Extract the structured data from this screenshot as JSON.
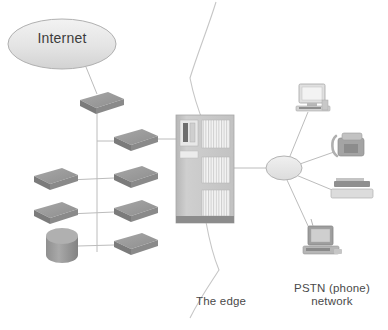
{
  "diagram": {
    "background": "#ffffff",
    "line_color": "#b9b9b9",
    "shape_fill": "#9a9a9a",
    "shape_fill_light": "#d9d9d9",
    "text_color": "#4a4a4a",
    "labels": {
      "internet": "Internet",
      "edge": "The edge",
      "pstn": "PSTN (phone)\nnetwork"
    },
    "nodes": [
      {
        "id": "internet-cloud",
        "type": "cloud-ellipse",
        "label": "Internet",
        "x": 62,
        "y": 44
      },
      {
        "id": "router-top",
        "type": "router-box",
        "label": "",
        "x": 96,
        "y": 99
      },
      {
        "id": "router-upper-right",
        "type": "router-box",
        "label": "",
        "x": 131,
        "y": 136
      },
      {
        "id": "router-mid-left",
        "type": "router-box",
        "label": "",
        "x": 50,
        "y": 175
      },
      {
        "id": "router-mid-right",
        "type": "router-box",
        "label": "",
        "x": 131,
        "y": 173
      },
      {
        "id": "router-low-left",
        "type": "router-box",
        "label": "",
        "x": 50,
        "y": 209
      },
      {
        "id": "router-low-right",
        "type": "router-box",
        "label": "",
        "x": 131,
        "y": 207
      },
      {
        "id": "server-cylinder",
        "type": "cylinder",
        "label": "",
        "x": 62,
        "y": 243
      },
      {
        "id": "router-bottom-right",
        "type": "router-box",
        "label": "",
        "x": 131,
        "y": 240
      },
      {
        "id": "edge-rack",
        "type": "telecom-rack",
        "label": "",
        "x": 205,
        "y": 175
      },
      {
        "id": "pstn-hub",
        "type": "hub-ellipse",
        "label": "",
        "x": 284,
        "y": 168
      },
      {
        "id": "desktop-computer",
        "type": "computer",
        "label": "",
        "x": 313,
        "y": 98
      },
      {
        "id": "desk-telephone",
        "type": "telephone",
        "label": "",
        "x": 349,
        "y": 145
      },
      {
        "id": "fax-printer",
        "type": "printer",
        "label": "",
        "x": 355,
        "y": 190
      },
      {
        "id": "workstation",
        "type": "workstation",
        "label": "",
        "x": 322,
        "y": 240
      }
    ],
    "edges": [
      {
        "from": "internet-cloud",
        "to": "router-top"
      },
      {
        "from": "router-top",
        "to": "trunk"
      },
      {
        "from": "trunk",
        "to": "router-upper-right"
      },
      {
        "from": "router-upper-right",
        "to": "edge-rack"
      },
      {
        "from": "router-mid-left",
        "to": "router-mid-right"
      },
      {
        "from": "router-low-left",
        "to": "router-low-right"
      },
      {
        "from": "server-cylinder",
        "to": "router-bottom-right"
      },
      {
        "from": "edge-rack",
        "to": "pstn-hub"
      },
      {
        "from": "pstn-hub",
        "to": "desktop-computer"
      },
      {
        "from": "pstn-hub",
        "to": "desk-telephone"
      },
      {
        "from": "pstn-hub",
        "to": "fax-printer"
      },
      {
        "from": "pstn-hub",
        "to": "workstation"
      },
      {
        "from": "edge-rack",
        "to": "edge-boundary-top"
      },
      {
        "from": "edge-rack",
        "to": "edge-boundary-bottom"
      }
    ]
  }
}
